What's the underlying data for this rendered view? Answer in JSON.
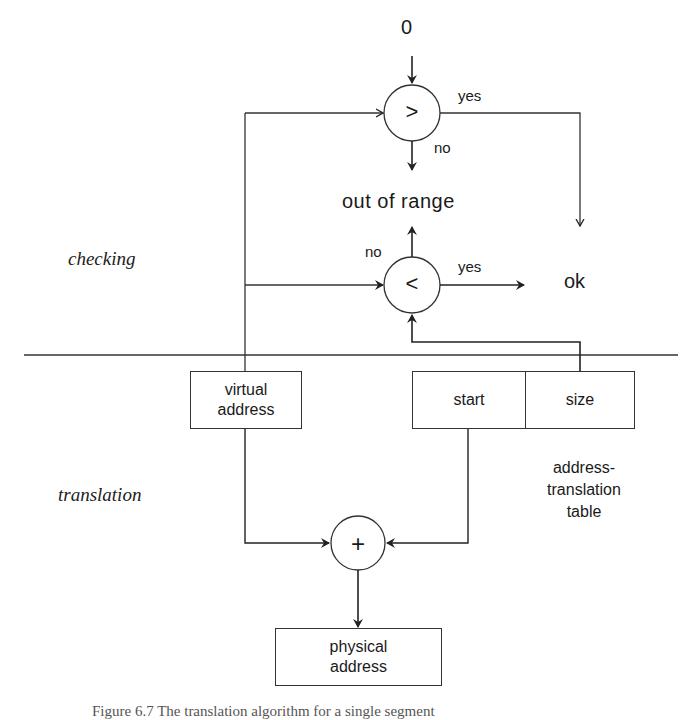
{
  "diagram": {
    "title_caption": "Figure 6.7 The translation algorithm for a single segment",
    "sections": {
      "checking": "checking",
      "translation": "translation"
    },
    "inputs": {
      "zero": "0"
    },
    "comparators": {
      "greater": {
        "symbol": ">",
        "yes_label": "yes",
        "no_label": "no"
      },
      "less": {
        "symbol": "<",
        "yes_label": "yes",
        "no_label": "no"
      }
    },
    "adder": {
      "symbol": "+"
    },
    "outcomes": {
      "out_of_range": "out of range",
      "ok": "ok"
    },
    "boxes": {
      "virtual_address": "virtual address",
      "start": "start",
      "size": "size",
      "physical_address": "physical address"
    },
    "table_label": "address-translation table",
    "table_label_lines": [
      "address-",
      "translation",
      "table"
    ],
    "virtual_address_lines": [
      "virtual",
      "address"
    ],
    "physical_address_lines": [
      "physical",
      "address"
    ],
    "colors": {
      "line": "#333333",
      "text": "#1a1a1a",
      "background": "#ffffff"
    }
  }
}
